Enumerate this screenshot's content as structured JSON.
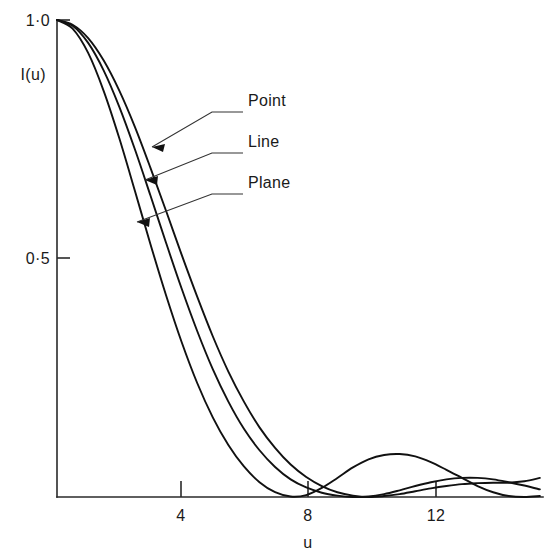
{
  "chart_data": {
    "type": "line",
    "title": "",
    "subtitle": "",
    "xlabel": "u",
    "ylabel": "I(u)",
    "xlim": [
      0,
      15.6
    ],
    "ylim": [
      0,
      1.0
    ],
    "grid": false,
    "legend_position": "inline-annotations",
    "x_ticks": [
      4,
      8,
      12
    ],
    "x_tick_labels": [
      "4",
      "8",
      "12"
    ],
    "y_ticks": [
      0.5,
      1.0
    ],
    "y_tick_labels": [
      "0·5",
      "1·0"
    ],
    "annotations": [
      {
        "label": "Point",
        "target_series": "Point",
        "target_u": 2.45,
        "target_I": 0.742
      },
      {
        "label": "Line",
        "target_series": "Line",
        "target_u": 2.2,
        "target_I": 0.672
      },
      {
        "label": "Plane",
        "target_series": "Plane",
        "target_u": 1.95,
        "target_I": 0.584
      }
    ],
    "series": [
      {
        "name": "Point",
        "x": [
          0,
          0.5,
          1,
          1.5,
          2,
          2.5,
          3,
          3.5,
          4,
          4.5,
          5,
          5.5,
          6,
          6.5,
          7,
          7.5,
          8,
          8.5,
          9,
          9.5,
          10,
          10.5,
          11,
          11.5,
          12,
          12.5,
          13,
          13.5,
          14,
          14.5,
          15,
          15.5
        ],
        "y": [
          1.0,
          0.99,
          0.962,
          0.915,
          0.852,
          0.776,
          0.69,
          0.6,
          0.508,
          0.42,
          0.337,
          0.263,
          0.2,
          0.146,
          0.103,
          0.068,
          0.042,
          0.023,
          0.01,
          0.003,
          0.0,
          0.002,
          0.006,
          0.012,
          0.018,
          0.023,
          0.027,
          0.029,
          0.03,
          0.03,
          0.033,
          0.04
        ]
      },
      {
        "name": "Line",
        "x": [
          0,
          0.5,
          1,
          1.5,
          2,
          2.5,
          3,
          3.5,
          4,
          4.5,
          5,
          5.5,
          6,
          6.5,
          7,
          7.5,
          8,
          8.5,
          9,
          9.5,
          10,
          10.5,
          11,
          11.5,
          12,
          12.5,
          13,
          13.5,
          14,
          14.5,
          15,
          15.5
        ],
        "y": [
          1.0,
          0.988,
          0.952,
          0.894,
          0.818,
          0.729,
          0.632,
          0.533,
          0.437,
          0.348,
          0.268,
          0.2,
          0.143,
          0.098,
          0.063,
          0.037,
          0.02,
          0.009,
          0.003,
          0.0,
          0.001,
          0.006,
          0.014,
          0.023,
          0.031,
          0.037,
          0.04,
          0.04,
          0.037,
          0.031,
          0.024,
          0.016
        ]
      },
      {
        "name": "Plane",
        "x": [
          0,
          0.5,
          1,
          1.5,
          2,
          2.5,
          3,
          3.5,
          4,
          4.5,
          5,
          5.5,
          6,
          6.5,
          7,
          7.5,
          8,
          8.5,
          9,
          9.5,
          10,
          10.5,
          11,
          11.5,
          12,
          12.5,
          13,
          13.5,
          14,
          14.5,
          15,
          15.5
        ],
        "y": [
          1.0,
          0.982,
          0.931,
          0.851,
          0.752,
          0.642,
          0.53,
          0.423,
          0.325,
          0.239,
          0.167,
          0.109,
          0.064,
          0.031,
          0.01,
          0.001,
          0.004,
          0.019,
          0.04,
          0.062,
          0.079,
          0.088,
          0.09,
          0.085,
          0.073,
          0.057,
          0.04,
          0.023,
          0.01,
          0.002,
          0.0,
          0.002
        ]
      }
    ],
    "colors": {
      "curve": "#111111",
      "axis": "#2a2a2a",
      "background": "#ffffff",
      "text": "#1a1a1a"
    }
  },
  "labels": {
    "y_axis_title": "I(u)",
    "x_axis_title": "u",
    "y_top": "1·0",
    "y_mid": "0·5",
    "x_tick_4": "4",
    "x_tick_8": "8",
    "x_tick_12": "12",
    "ann_point": "Point",
    "ann_line": "Line",
    "ann_plane": "Plane"
  }
}
